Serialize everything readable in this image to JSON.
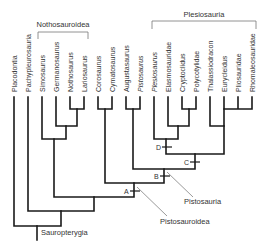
{
  "diagram": {
    "type": "cladogram",
    "taxa": [
      {
        "name": "Placodontia",
        "x": 14
      },
      {
        "name": "Pachypleurosauria",
        "x": 28
      },
      {
        "name": "Simosaurus",
        "x": 42
      },
      {
        "name": "Germanosaurus",
        "x": 56
      },
      {
        "name": "Nothosaurus",
        "x": 70
      },
      {
        "name": "Lariosaurus",
        "x": 84
      },
      {
        "name": "Corosaurus",
        "x": 98
      },
      {
        "name": "Cymatosaurus",
        "x": 112
      },
      {
        "name": "Augustasaurus",
        "x": 126
      },
      {
        "name": "Pistosaurus",
        "x": 140
      },
      {
        "name": "Plesiosaurus",
        "x": 154
      },
      {
        "name": "Elasmosauridae",
        "x": 168
      },
      {
        "name": "Cryptoclidus",
        "x": 182
      },
      {
        "name": "Polycotylidae",
        "x": 196
      },
      {
        "name": "Thalassiodracon",
        "x": 210
      },
      {
        "name": "Eurycleidus",
        "x": 224
      },
      {
        "name": "Pliosauridae",
        "x": 238
      },
      {
        "name": "Rhomaleosauridae",
        "x": 252
      }
    ],
    "groups": {
      "nothosauroidea": "Nothosauroidea",
      "plesiosauria": "Plesiosauria",
      "sauropterygia": "Sauropterygia",
      "pistosauroidea": "Pistosauroidea",
      "pistosauria": "Pistosauria"
    },
    "nodes": {
      "A": "A",
      "B": "B",
      "C": "C",
      "D": "D"
    },
    "colors": {
      "branch": "#1a1a1a",
      "bracket": "#777777",
      "text": "#333333"
    }
  }
}
